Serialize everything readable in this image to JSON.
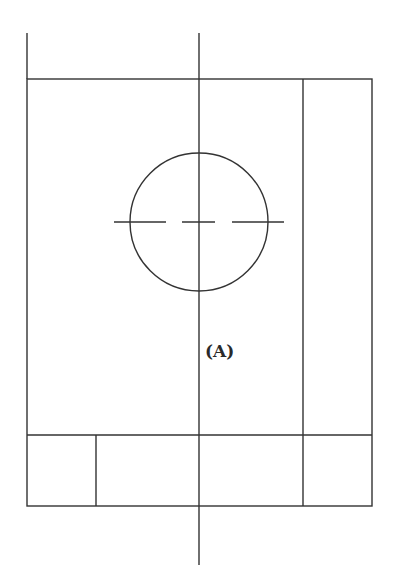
{
  "diagram": {
    "type": "technical-drawing-view",
    "line_color": "#333333",
    "background": "#ffffff",
    "label": "(A)",
    "outline": {
      "x": 27,
      "y": 79,
      "width": 345,
      "height": 427
    },
    "centerline_vertical": {
      "x": 199,
      "y1": 33,
      "y2": 565
    },
    "left_extension": {
      "x": 27,
      "y1": 33,
      "y2": 79
    },
    "right_strip_divider_x": 303,
    "base_divider_y": 435,
    "base_dividers_x": [
      96,
      199,
      303
    ],
    "hole": {
      "cx": 199,
      "cy": 222,
      "r": 69
    },
    "hole_centerline_dashes": [
      {
        "x1": 114,
        "x2": 166
      },
      {
        "x1": 182,
        "x2": 215
      },
      {
        "x1": 232,
        "x2": 284
      }
    ]
  }
}
